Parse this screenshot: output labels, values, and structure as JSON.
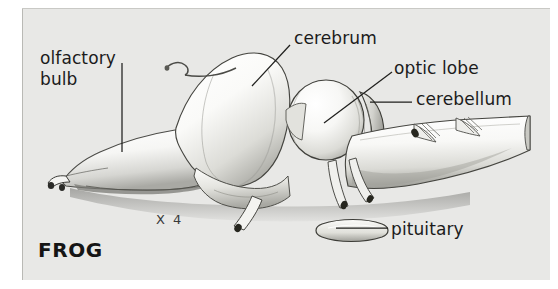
{
  "plate": {
    "background_color": "#e8e8e6",
    "page_color": "#ffffff",
    "ink_color": "#1b1b1b",
    "caption": "FROG",
    "magnification": "X 4"
  },
  "figure": {
    "technique": "airbrush / pencil rendering"
  },
  "labels": [
    {
      "id": "olfactory-bulb",
      "line1": "olfactory",
      "line2": "bulb",
      "text": "olfactory bulb"
    },
    {
      "id": "cerebrum",
      "text": "cerebrum"
    },
    {
      "id": "optic-lobe",
      "text": "optic lobe"
    },
    {
      "id": "cerebellum",
      "text": "cerebellum"
    },
    {
      "id": "pituitary",
      "text": "pituitary"
    }
  ]
}
